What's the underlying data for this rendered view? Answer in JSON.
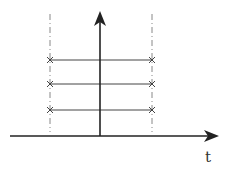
{
  "diagram": {
    "axis_label": "t",
    "colors": {
      "line": "#2a2a2a",
      "dashed": "#777777",
      "marker": "#555555"
    },
    "vertical_arrow": {
      "x": 100,
      "y_top": 12,
      "y_bottom": 136
    },
    "horizontal_axis": {
      "y": 136,
      "x_start": 10,
      "x_end": 218
    },
    "dashed_lines_x": [
      50,
      152
    ],
    "dashed_range": {
      "y_top": 14,
      "y_bottom": 132
    },
    "horizontal_segments": [
      {
        "y": 60,
        "x1": 50,
        "x2": 152,
        "marker": "cross"
      },
      {
        "y": 84,
        "x1": 50,
        "x2": 152,
        "marker": "cross"
      },
      {
        "y": 110,
        "x1": 50,
        "x2": 152,
        "marker": "cross"
      }
    ]
  }
}
